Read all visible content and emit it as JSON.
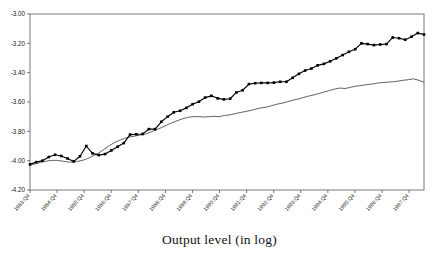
{
  "caption": "Output level (in log)",
  "chart_data": {
    "type": "line",
    "title": "",
    "subtitle": "",
    "xlabel": "Output level (in log)",
    "ylabel": "",
    "ylim": [
      -4.2,
      -3.0
    ],
    "ytick_labels": [
      "-3.00",
      "-3.20",
      "-3.40",
      "-3.60",
      "-3.80",
      "-4.00",
      "-4.20"
    ],
    "ytick_values": [
      -3.0,
      -3.2,
      -3.4,
      -3.6,
      -3.8,
      -4.0,
      -4.2
    ],
    "grid": false,
    "legend": "none",
    "frame": "box",
    "xtick_labels": [
      "1983:Q4",
      "1984:Q4",
      "1985:Q4",
      "1986:Q4",
      "1987:Q4",
      "1988:Q4",
      "1989:Q4",
      "1990:Q4",
      "1991:Q4",
      "1992:Q4",
      "1993:Q4",
      "1994:Q4",
      "1995:Q4",
      "1996:Q4",
      "1997:Q4"
    ],
    "x_quarters": [
      "1983:Q4",
      "1984:Q1",
      "1984:Q2",
      "1984:Q3",
      "1984:Q4",
      "1985:Q1",
      "1985:Q2",
      "1985:Q3",
      "1985:Q4",
      "1986:Q1",
      "1986:Q2",
      "1986:Q3",
      "1986:Q4",
      "1987:Q1",
      "1987:Q2",
      "1987:Q3",
      "1987:Q4",
      "1988:Q1",
      "1988:Q2",
      "1988:Q3",
      "1988:Q4",
      "1989:Q1",
      "1989:Q2",
      "1989:Q3",
      "1989:Q4",
      "1990:Q1",
      "1990:Q2",
      "1990:Q3",
      "1990:Q4",
      "1991:Q1",
      "1991:Q2",
      "1991:Q3",
      "1991:Q4",
      "1992:Q1",
      "1992:Q2",
      "1992:Q3",
      "1992:Q4",
      "1993:Q1",
      "1993:Q2",
      "1993:Q3",
      "1993:Q4",
      "1994:Q1",
      "1994:Q2",
      "1994:Q3",
      "1994:Q4",
      "1995:Q1",
      "1995:Q2",
      "1995:Q3",
      "1995:Q4",
      "1996:Q1",
      "1996:Q2",
      "1996:Q3",
      "1996:Q4",
      "1997:Q1",
      "1997:Q2",
      "1997:Q3",
      "1997:Q4"
    ],
    "series": [
      {
        "name": "actual-output",
        "style": "line-with-square-markers",
        "color": "#000000",
        "marker": "square",
        "values": [
          -4.025,
          -4.01,
          -4.0,
          -3.975,
          -3.96,
          -3.968,
          -3.985,
          -4.005,
          -3.97,
          -3.9,
          -3.95,
          -3.962,
          -3.955,
          -3.93,
          -3.905,
          -3.88,
          -3.822,
          -3.82,
          -3.818,
          -3.785,
          -3.785,
          -3.735,
          -3.7,
          -3.67,
          -3.66,
          -3.64,
          -3.615,
          -3.598,
          -3.57,
          -3.558,
          -3.575,
          -3.582,
          -3.578,
          -3.535,
          -3.52,
          -3.478,
          -3.472,
          -3.47,
          -3.47,
          -3.468,
          -3.462,
          -3.462,
          -3.435,
          -3.408,
          -3.385,
          -3.372,
          -3.35,
          -3.34,
          -3.322,
          -3.302,
          -3.28,
          -3.258,
          -3.24,
          -3.2,
          -3.205,
          -3.212,
          -3.208,
          -3.205,
          -3.16,
          -3.165,
          -3.175,
          -3.155,
          -3.13,
          -3.14
        ]
      },
      {
        "name": "potential-output-trend",
        "style": "thin-line",
        "color": "#3a3a3a",
        "marker": "none",
        "values": [
          -4.03,
          -4.022,
          -4.012,
          -4.004,
          -3.998,
          -3.998,
          -4.002,
          -4.008,
          -4.01,
          -4.005,
          -3.998,
          -3.985,
          -3.968,
          -3.95,
          -3.925,
          -3.9,
          -3.878,
          -3.862,
          -3.848,
          -3.838,
          -3.832,
          -3.825,
          -3.818,
          -3.805,
          -3.79,
          -3.775,
          -3.758,
          -3.742,
          -3.728,
          -3.715,
          -3.705,
          -3.7,
          -3.7,
          -3.702,
          -3.7,
          -3.698,
          -3.7,
          -3.692,
          -3.688,
          -3.68,
          -3.672,
          -3.665,
          -3.658,
          -3.648,
          -3.64,
          -3.635,
          -3.625,
          -3.615,
          -3.608,
          -3.598,
          -3.588,
          -3.58,
          -3.57,
          -3.56,
          -3.552,
          -3.542,
          -3.532,
          -3.522,
          -3.512,
          -3.505,
          -3.508,
          -3.5,
          -3.492,
          -3.488,
          -3.482,
          -3.478,
          -3.472,
          -3.468,
          -3.465,
          -3.462,
          -3.458,
          -3.452,
          -3.448,
          -3.442,
          -3.452,
          -3.465
        ]
      }
    ]
  }
}
